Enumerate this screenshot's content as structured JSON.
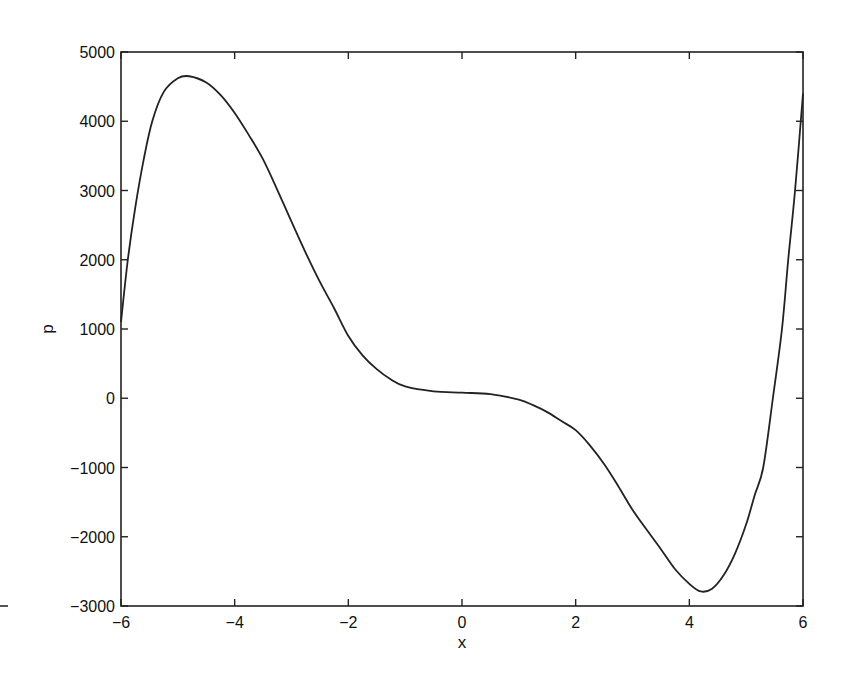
{
  "chart_data": {
    "type": "line",
    "title": "",
    "xlabel": "x",
    "ylabel": "p",
    "xlim": [
      -6,
      6
    ],
    "ylim": [
      -3000,
      5000
    ],
    "grid": false,
    "legend": null,
    "xticks": [
      -6,
      -4,
      -2,
      0,
      2,
      4,
      6
    ],
    "xtick_labels": [
      "−6",
      "−4",
      "−2",
      "0",
      "2",
      "4",
      "6"
    ],
    "yticks": [
      -3000,
      -2000,
      -1000,
      0,
      1000,
      2000,
      3000,
      4000,
      5000
    ],
    "ytick_labels": [
      "−3000",
      "−2000",
      "−1000",
      "0",
      "1000",
      "2000",
      "3000",
      "4000",
      "5000"
    ],
    "series": [
      {
        "name": "p(x)",
        "color": "#222222",
        "x": [
          -6,
          -5.88,
          -5.75,
          -5.6,
          -5.45,
          -5.25,
          -5.0,
          -4.8,
          -4.5,
          -4.25,
          -4.0,
          -3.75,
          -3.5,
          -3.25,
          -3.0,
          -2.75,
          -2.5,
          -2.25,
          -2.0,
          -1.75,
          -1.5,
          -1.25,
          -1.0,
          -0.5,
          0,
          0.5,
          1.0,
          1.25,
          1.5,
          1.75,
          2.0,
          2.25,
          2.5,
          2.75,
          3.0,
          3.25,
          3.5,
          3.75,
          4.0,
          4.2,
          4.4,
          4.6,
          4.8,
          5.0,
          5.15,
          5.3,
          5.47,
          5.63,
          5.74,
          5.86,
          6.0
        ],
        "y": [
          1100,
          2000,
          2750,
          3450,
          4000,
          4420,
          4620,
          4650,
          4560,
          4380,
          4120,
          3800,
          3450,
          3010,
          2550,
          2100,
          1680,
          1300,
          900,
          620,
          420,
          270,
          170,
          100,
          80,
          60,
          -20,
          -100,
          -200,
          -330,
          -460,
          -680,
          -950,
          -1270,
          -1610,
          -1900,
          -2180,
          -2470,
          -2680,
          -2790,
          -2750,
          -2560,
          -2250,
          -1820,
          -1400,
          -1000,
          0,
          1000,
          2000,
          3000,
          4400
        ]
      }
    ]
  },
  "stray_mark": "–"
}
